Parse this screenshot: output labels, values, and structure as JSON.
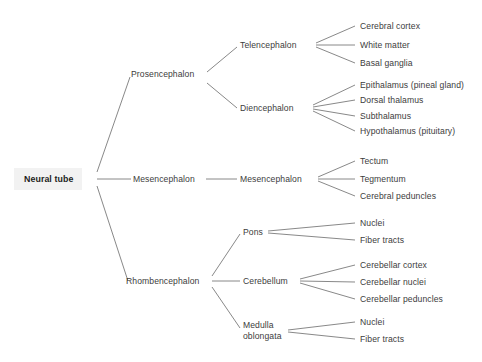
{
  "diagram": {
    "type": "tree",
    "orientation": "left-to-right",
    "colors": {
      "edge": "#7b7b7b",
      "text": "#3c3c3c",
      "root_text": "#1d1d1d",
      "root_background": "#f2f2f2",
      "page_background": "#ffffff"
    },
    "root": {
      "label": "Neural tube"
    },
    "level2": [
      {
        "label": "Prosencephalon"
      },
      {
        "label": "Mesencephalon"
      },
      {
        "label": "Rhombencephalon"
      }
    ],
    "level3": [
      {
        "label": "Telencephalon"
      },
      {
        "label": "Diencephalon"
      },
      {
        "label": "Mesencephalon"
      },
      {
        "label": "Pons"
      },
      {
        "label": "Cerebellum"
      },
      {
        "label": "Medulla oblongata"
      }
    ],
    "leaves": [
      {
        "label": "Cerebral cortex"
      },
      {
        "label": "White matter"
      },
      {
        "label": "Basal ganglia"
      },
      {
        "label": "Epithalamus (pineal gland)"
      },
      {
        "label": "Dorsal thalamus"
      },
      {
        "label": "Subthalamus"
      },
      {
        "label": "Hypothalamus (pituitary)"
      },
      {
        "label": "Tectum"
      },
      {
        "label": "Tegmentum"
      },
      {
        "label": "Cerebral peduncles"
      },
      {
        "label": "Nuclei"
      },
      {
        "label": "Fiber tracts"
      },
      {
        "label": "Cerebellar cortex"
      },
      {
        "label": "Cerebellar nuclei"
      },
      {
        "label": "Cerebellar peduncles"
      },
      {
        "label": "Nuclei"
      },
      {
        "label": "Fiber tracts"
      }
    ]
  }
}
